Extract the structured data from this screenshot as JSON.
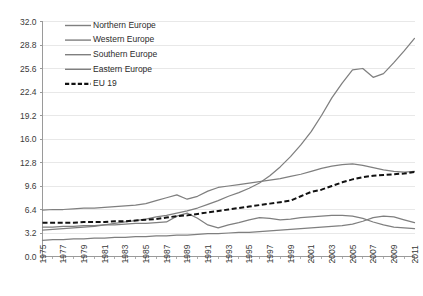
{
  "chart_data": {
    "type": "line",
    "title": "",
    "xlabel": "",
    "ylabel": "",
    "xlim": [
      1975,
      2011
    ],
    "ylim": [
      0.0,
      32.0
    ],
    "grid": true,
    "legend_position": "top-left inside plot",
    "ytick_labels": [
      "0.0",
      "3.2",
      "6.4",
      "9.6",
      "12.8",
      "16.0",
      "19.2",
      "22.4",
      "25.6",
      "28.8",
      "32.0"
    ],
    "ytick_values": [
      0.0,
      3.2,
      6.4,
      9.6,
      12.8,
      16.0,
      19.2,
      22.4,
      25.6,
      28.8,
      32.0
    ],
    "xtick_labels": [
      "1975",
      "1977",
      "1979",
      "1981",
      "1983",
      "1985",
      "1987",
      "1989",
      "1991",
      "1993",
      "1995",
      "1997",
      "1999",
      "2001",
      "2003",
      "2005",
      "2007",
      "2009",
      "2011"
    ],
    "xtick_values": [
      1975,
      1977,
      1979,
      1981,
      1983,
      1985,
      1987,
      1989,
      1991,
      1993,
      1995,
      1997,
      1999,
      2001,
      2003,
      2005,
      2007,
      2009,
      2011
    ],
    "x": [
      1975,
      1976,
      1977,
      1978,
      1979,
      1980,
      1981,
      1982,
      1983,
      1984,
      1985,
      1986,
      1987,
      1988,
      1989,
      1990,
      1991,
      1992,
      1993,
      1994,
      1995,
      1996,
      1997,
      1998,
      1999,
      2000,
      2001,
      2002,
      2003,
      2004,
      2005,
      2006,
      2007,
      2008,
      2009,
      2010,
      2011
    ],
    "series": [
      {
        "name": "Northern Europe",
        "color": "#7f7f7f",
        "style": "solid",
        "values": [
          3.6,
          3.7,
          3.8,
          3.9,
          4.0,
          4.1,
          4.3,
          4.5,
          4.7,
          4.9,
          5.1,
          5.4,
          5.6,
          5.9,
          6.2,
          6.6,
          7.1,
          7.6,
          8.2,
          8.7,
          9.3,
          10.0,
          11.0,
          12.2,
          13.6,
          15.2,
          17.0,
          19.2,
          21.6,
          23.6,
          25.4,
          25.6,
          24.4,
          24.9,
          26.4,
          28.0,
          29.7
        ]
      },
      {
        "name": "Western Europe",
        "color": "#7f7f7f",
        "style": "solid",
        "values": [
          6.3,
          6.4,
          6.4,
          6.5,
          6.6,
          6.6,
          6.7,
          6.8,
          6.9,
          7.0,
          7.2,
          7.6,
          8.0,
          8.4,
          7.8,
          8.2,
          8.9,
          9.4,
          9.6,
          9.8,
          10.0,
          10.2,
          10.4,
          10.6,
          10.9,
          11.2,
          11.6,
          12.0,
          12.3,
          12.5,
          12.6,
          12.4,
          12.1,
          11.8,
          11.6,
          11.5,
          11.6
        ]
      },
      {
        "name": "Southern Europe",
        "color": "#7f7f7f",
        "style": "solid",
        "values": [
          2.2,
          2.3,
          2.3,
          2.4,
          2.4,
          2.5,
          2.5,
          2.6,
          2.6,
          2.7,
          2.7,
          2.8,
          2.8,
          2.9,
          2.9,
          3.0,
          3.1,
          3.1,
          3.2,
          3.3,
          3.3,
          3.4,
          3.5,
          3.6,
          3.7,
          3.8,
          3.9,
          4.0,
          4.1,
          4.2,
          4.4,
          4.8,
          5.3,
          5.5,
          5.4,
          5.0,
          4.6
        ]
      },
      {
        "name": "Eastern Europe",
        "color": "#7f7f7f",
        "style": "solid",
        "values": [
          4.0,
          4.0,
          4.1,
          4.1,
          4.2,
          4.2,
          4.3,
          4.3,
          4.4,
          4.5,
          4.5,
          4.6,
          4.7,
          5.5,
          5.9,
          5.2,
          4.3,
          3.9,
          4.3,
          4.6,
          5.0,
          5.3,
          5.2,
          5.0,
          5.1,
          5.3,
          5.4,
          5.5,
          5.6,
          5.6,
          5.5,
          5.2,
          4.7,
          4.3,
          4.0,
          3.9,
          3.8
        ]
      },
      {
        "name": "EU 19",
        "color": "#111111",
        "style": "dashed",
        "values": [
          4.6,
          4.6,
          4.6,
          4.6,
          4.7,
          4.7,
          4.7,
          4.8,
          4.8,
          4.9,
          5.0,
          5.1,
          5.3,
          5.5,
          5.6,
          5.8,
          6.0,
          6.2,
          6.4,
          6.6,
          6.8,
          7.0,
          7.2,
          7.4,
          7.6,
          8.2,
          8.8,
          9.1,
          9.6,
          10.1,
          10.5,
          10.8,
          11.0,
          11.1,
          11.2,
          11.3,
          11.5
        ]
      }
    ]
  },
  "legend": {
    "items": [
      {
        "label": "Northern Europe"
      },
      {
        "label": "Western Europe"
      },
      {
        "label": "Southern Europe"
      },
      {
        "label": "Eastern Europe"
      },
      {
        "label": "EU 19"
      }
    ]
  }
}
